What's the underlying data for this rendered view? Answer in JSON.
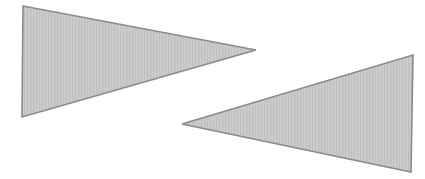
{
  "figure": {
    "width": 425,
    "height": 179,
    "background_color": "#ffffff",
    "fill_color": "#c6c6c6",
    "fill_texture": "fine vertical stipple / halftone stripes",
    "stroke_color": "#8a8a8a",
    "stroke_width": 1.6
  },
  "shapes": [
    {
      "id": "left-triangle",
      "name": "left-triangle",
      "label": "Left triangle pointing right",
      "type": "triangle",
      "orientation": "points-right",
      "fill_color": "#c6c6c6",
      "stroke_color": "#8a8a8a",
      "points": "23,6 256,50 22,117",
      "vertices": [
        {
          "label": "top-left",
          "x": 23,
          "y": 6
        },
        {
          "label": "right-apex",
          "x": 256,
          "y": 50
        },
        {
          "label": "bottom-left",
          "x": 22,
          "y": 117
        }
      ]
    },
    {
      "id": "right-triangle",
      "name": "right-triangle",
      "label": "Right triangle pointing left",
      "type": "triangle",
      "orientation": "points-left",
      "fill_color": "#c6c6c6",
      "stroke_color": "#8a8a8a",
      "points": "182,124 413,55 411,172",
      "vertices": [
        {
          "label": "left-apex",
          "x": 182,
          "y": 124
        },
        {
          "label": "top-right",
          "x": 413,
          "y": 55
        },
        {
          "label": "bottom-right",
          "x": 411,
          "y": 172
        }
      ]
    }
  ]
}
